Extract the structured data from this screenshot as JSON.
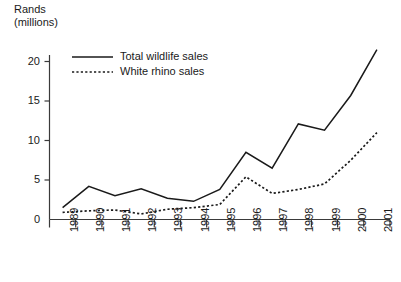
{
  "chart_data": {
    "type": "line",
    "title": "",
    "ylabel": "Rands\n(millions)",
    "ylabel_line1": "Rands",
    "ylabel_line2": "(millions)",
    "xlabel": "",
    "categories": [
      "1989",
      "1990",
      "1991",
      "1992",
      "1993",
      "1994",
      "1995",
      "1996",
      "1997",
      "1998",
      "1999",
      "2000",
      "2001"
    ],
    "yticks": [
      "0",
      "5",
      "10",
      "15",
      "20"
    ],
    "ylim": [
      0,
      22.5
    ],
    "grid": false,
    "legend_position": "top-left-inside",
    "series": [
      {
        "name": "Total wildlife sales",
        "style": "solid",
        "color": "#1a1a1a",
        "values": [
          1.5,
          4.2,
          3.0,
          3.9,
          2.7,
          2.3,
          3.8,
          8.5,
          6.5,
          12.1,
          11.3,
          15.7,
          21.5
        ]
      },
      {
        "name": "White rhino sales",
        "style": "dotted",
        "color": "#1a1a1a",
        "values": [
          0.9,
          1.1,
          1.2,
          0.7,
          1.3,
          1.5,
          1.9,
          5.4,
          3.3,
          3.8,
          4.5,
          7.5,
          11.0
        ]
      }
    ]
  },
  "legend": {
    "items": [
      {
        "label": "Total wildlife sales",
        "style": "solid"
      },
      {
        "label": "White rhino sales",
        "style": "dotted"
      }
    ]
  }
}
